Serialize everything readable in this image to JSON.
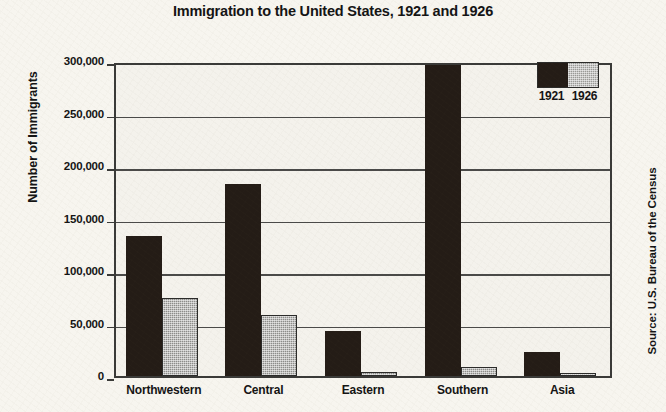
{
  "chart_data": {
    "type": "bar",
    "title": "Immigration to the United States, 1921 and 1926",
    "xlabel": "",
    "ylabel": "Number of Immigrants",
    "categories": [
      "Northwestern",
      "Central",
      "Eastern",
      "Southern",
      "Asia"
    ],
    "series": [
      {
        "name": "1921",
        "color": "#241c16",
        "values": [
          133000,
          183000,
          43000,
          296000,
          23000
        ]
      },
      {
        "name": "1926",
        "color": "#8d8d8a",
        "values": [
          74000,
          58000,
          4000,
          9000,
          3000
        ]
      }
    ],
    "ylim": [
      0,
      300000
    ],
    "ytick_values": [
      0,
      50000,
      100000,
      150000,
      200000,
      250000,
      300000
    ],
    "ytick_labels": [
      "0",
      "50,000",
      "100,000",
      "150,000",
      "200,000",
      "250,000",
      "300,000"
    ],
    "grid": true,
    "legend_position": "top-right",
    "annotations": [
      "Source: U.S. Bureau of the Census"
    ]
  },
  "source_note": "Source: U.S. Bureau of the Census",
  "legend": {
    "entries": [
      {
        "label": "1921"
      },
      {
        "label": "1926"
      }
    ]
  }
}
